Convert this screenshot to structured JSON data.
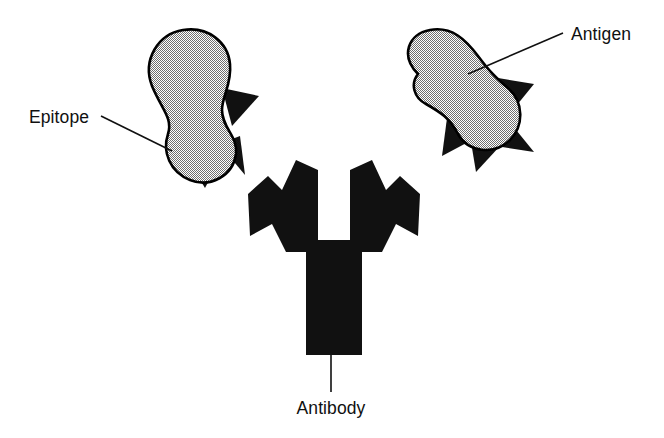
{
  "figure": {
    "background_color": "#ffffff",
    "width": 664,
    "height": 438
  },
  "colors": {
    "ink": "#101010",
    "antigen_fill": "#b5b5b5",
    "antigen_outline": "#000000",
    "epitope_fill": "#111111",
    "antibody_fill": "#111111",
    "background": "#ffffff"
  },
  "labels": {
    "epitope": "Epitope",
    "antigen": "Antigen",
    "antibody": "Antibody"
  },
  "structures": {
    "antigen_left": {
      "name": "Antigen",
      "shape": "peanut-capsule",
      "fill": "#b5b5b5",
      "epitope_count": 3
    },
    "antigen_right": {
      "name": "Antigen",
      "shape": "peanut-capsule",
      "fill": "#b5b5b5",
      "epitope_count": 4
    },
    "antibody": {
      "name": "Antibody",
      "shape": "Y",
      "fill": "#111111",
      "binding_sites": 2
    }
  }
}
